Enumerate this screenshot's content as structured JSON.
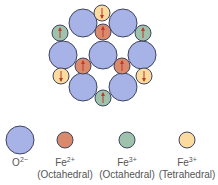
{
  "colors": {
    "O2": "#a7b2e6",
    "Fe2_oct": "#d98a6c",
    "Fe3_oct": "#9ec2ab",
    "Fe3_tet": "#fbdc9e",
    "stroke": "#3f4560",
    "arrow": "#c0392b"
  },
  "lattice": {
    "oxygen": [
      {
        "cx": 83,
        "cy": 23
      },
      {
        "cx": 123,
        "cy": 23
      },
      {
        "cx": 63,
        "cy": 55
      },
      {
        "cx": 103,
        "cy": 55
      },
      {
        "cx": 142,
        "cy": 55
      },
      {
        "cx": 83,
        "cy": 87
      },
      {
        "cx": 123,
        "cy": 87
      }
    ],
    "fe2_oct": [
      {
        "cx": 103,
        "cy": 32,
        "dir": "up"
      },
      {
        "cx": 83,
        "cy": 66,
        "dir": "up"
      },
      {
        "cx": 122,
        "cy": 66,
        "dir": "up"
      }
    ],
    "fe3_oct": [
      {
        "cx": 60,
        "cy": 33,
        "dir": "up"
      },
      {
        "cx": 143,
        "cy": 33,
        "dir": "up"
      },
      {
        "cx": 103,
        "cy": 98,
        "dir": "up"
      }
    ],
    "fe3_tet": [
      {
        "cx": 102,
        "cy": 13,
        "dir": "down"
      },
      {
        "cx": 61,
        "cy": 76,
        "dir": "down"
      },
      {
        "cx": 144,
        "cy": 76,
        "dir": "down"
      }
    ]
  },
  "legend": [
    {
      "key": "O2",
      "cx": 20,
      "cy": 140,
      "r": 14,
      "base": "O",
      "charge": "2−",
      "sub": ""
    },
    {
      "key": "Fe2_oct",
      "cx": 65,
      "cy": 140,
      "r": 8,
      "base": "Fe",
      "charge": "2+",
      "sub": "(Octahedral)"
    },
    {
      "key": "Fe3_oct",
      "cx": 127,
      "cy": 140,
      "r": 8,
      "base": "Fe",
      "charge": "3+",
      "sub": "(Octahedral)"
    },
    {
      "key": "Fe3_tet",
      "cx": 187,
      "cy": 140,
      "r": 8,
      "base": "Fe",
      "charge": "3+",
      "sub": "(Tetrahedral)"
    }
  ]
}
